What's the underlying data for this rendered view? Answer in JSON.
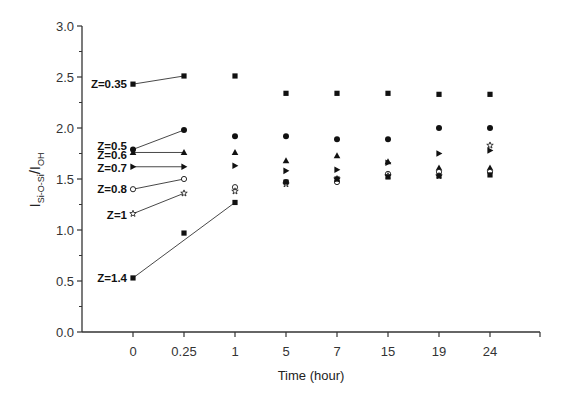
{
  "chart_data": {
    "type": "scatter",
    "title": "",
    "xlabel": "Time (hour)",
    "ylabel": "I_Si-O-Si / I_OH",
    "ylabel_parts": {
      "main1": "I",
      "sub1": "Si-O-Si",
      "slash": "/",
      "main2": "I",
      "sub2": "OH"
    },
    "categories": [
      "0",
      "0.25",
      "1",
      "5",
      "7",
      "15",
      "19",
      "24"
    ],
    "ylim": [
      0.0,
      3.0
    ],
    "yticks": [
      "0.0",
      "0.5",
      "1.0",
      "1.5",
      "2.0",
      "2.5",
      "3.0"
    ],
    "grid": false,
    "legend": "inline labels at left of t=0 points",
    "series": [
      {
        "name": "Z=0.35",
        "marker": "square",
        "values": [
          2.43,
          2.51,
          2.51,
          2.34,
          2.34,
          2.34,
          2.33,
          2.33
        ],
        "connected_indices": [
          0,
          1
        ]
      },
      {
        "name": "Z=0.5",
        "marker": "circle",
        "values": [
          1.79,
          1.98,
          1.92,
          1.92,
          1.89,
          1.89,
          2.0,
          2.0
        ],
        "connected_indices": [
          0,
          1
        ]
      },
      {
        "name": "Z=0.6",
        "marker": "triangle-up",
        "values": [
          1.76,
          1.76,
          1.76,
          1.68,
          1.73,
          1.67,
          1.61,
          1.61
        ],
        "connected_indices": [
          0,
          1
        ]
      },
      {
        "name": "Z=0.7",
        "marker": "triangle-right",
        "values": [
          1.62,
          1.62,
          1.63,
          1.58,
          1.59,
          1.66,
          1.75,
          1.78
        ],
        "connected_indices": [
          0,
          1
        ]
      },
      {
        "name": "Z=0.8",
        "marker": "open-circle",
        "values": [
          1.4,
          1.5,
          1.42,
          1.47,
          1.47,
          1.55,
          1.57,
          1.57
        ],
        "connected_indices": [
          0,
          1
        ]
      },
      {
        "name": "Z=1",
        "marker": "star",
        "values": [
          1.16,
          1.36,
          1.38,
          1.45,
          1.5,
          1.53,
          1.53,
          1.83
        ],
        "connected_indices": [
          0,
          1
        ]
      },
      {
        "name": "Z=1.4",
        "marker": "square",
        "values": [
          0.53,
          0.97,
          1.27,
          1.47,
          1.5,
          1.52,
          1.53,
          1.54
        ],
        "connected_indices": [
          0,
          2
        ]
      }
    ]
  }
}
